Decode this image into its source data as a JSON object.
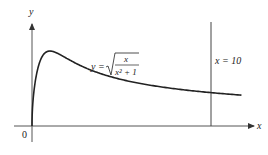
{
  "figure": {
    "function_label": {
      "lhs": "y =",
      "numerator": "x",
      "denominator": "x² + 1"
    },
    "vertical_line_label": "x = 10",
    "x_axis_label": "x",
    "y_axis_label": "y",
    "origin_label": "0",
    "colors": {
      "curve": "#222222",
      "axes": "#555555",
      "vline": "#444444"
    }
  },
  "chart_data": {
    "type": "line",
    "title": "",
    "function": "y = sqrt(x / (x^2 + 1))",
    "xlabel": "x",
    "ylabel": "y",
    "x_range": [
      0,
      11.7
    ],
    "vertical_line_x": 10,
    "peak": {
      "x": 1,
      "y": 0.707
    },
    "grid": false,
    "series": [
      {
        "name": "y = sqrt(x/(x^2+1))",
        "x": [
          0,
          0.05,
          0.1,
          0.2,
          0.35,
          0.5,
          0.75,
          1,
          1.5,
          2,
          3,
          4,
          5,
          6,
          7,
          8,
          9,
          10,
          11,
          11.7
        ],
        "values": [
          0,
          0.223,
          0.315,
          0.439,
          0.558,
          0.632,
          0.693,
          0.707,
          0.679,
          0.632,
          0.548,
          0.485,
          0.439,
          0.405,
          0.374,
          0.351,
          0.331,
          0.315,
          0.3,
          0.291
        ]
      }
    ]
  }
}
